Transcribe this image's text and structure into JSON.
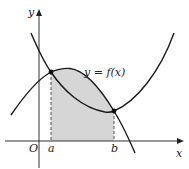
{
  "diagram": {
    "axes": {
      "x_label": "x",
      "y_label": "y",
      "origin_label": "O"
    },
    "points": {
      "a_label": "a",
      "b_label": "b"
    },
    "curve_label": "y = f(x)",
    "colors": {
      "curve": "#1a1a1a",
      "shade": "#d6d6d6",
      "dashed": "#555555",
      "axis": "#333333"
    }
  }
}
